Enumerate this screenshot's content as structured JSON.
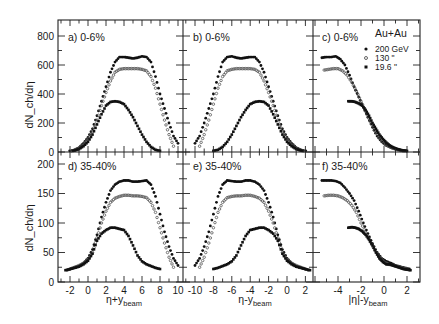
{
  "figure": {
    "system_label": "Au+Au",
    "ylabel": "dN_ch/dη",
    "legend": [
      {
        "label": "200 GeV",
        "marker": "filled-circle",
        "color": "#111111"
      },
      {
        "label": "130  \"",
        "marker": "open-circle",
        "color": "#555555"
      },
      {
        "label": "19.6  \"",
        "marker": "filled-square",
        "color": "#111111"
      }
    ]
  },
  "chart_data": [
    {
      "panel": "a",
      "title": "a) 0-6%",
      "type": "scatter",
      "xlabel": "η+y_beam",
      "ylabel": "dN_ch/dη",
      "xlim": [
        -3.3,
        10.6
      ],
      "ylim": [
        0,
        900
      ],
      "yticks": [
        0,
        200,
        400,
        600,
        800
      ],
      "series": [
        {
          "name": "200 GeV",
          "x": [
            -2.3,
            -1.5,
            -1,
            -0.5,
            0,
            0.5,
            1,
            1.5,
            2,
            2.5,
            3,
            3.5,
            4,
            4.5,
            5,
            5.5,
            6,
            6.5,
            7,
            7.5,
            8,
            8.5,
            9,
            9.5,
            10
          ],
          "y": [
            5,
            15,
            30,
            60,
            100,
            160,
            250,
            350,
            450,
            550,
            620,
            655,
            655,
            650,
            645,
            650,
            660,
            655,
            620,
            520,
            400,
            300,
            200,
            110,
            60
          ]
        },
        {
          "name": "130 GeV",
          "x": [
            -2,
            -1.5,
            -1,
            -0.5,
            0,
            0.5,
            1,
            1.5,
            2,
            2.5,
            3,
            3.5,
            4,
            4.5,
            5,
            5.5,
            6,
            6.5,
            7,
            7.5,
            8,
            8.5,
            9,
            9.5
          ],
          "y": [
            5,
            12,
            25,
            50,
            90,
            140,
            220,
            320,
            410,
            490,
            550,
            570,
            575,
            575,
            575,
            575,
            570,
            560,
            520,
            440,
            330,
            220,
            120,
            40
          ]
        },
        {
          "name": "19.6 GeV",
          "x": [
            -2.5,
            -2,
            -1.5,
            -1,
            -0.5,
            0,
            0.5,
            1,
            1.5,
            2,
            2.5,
            3,
            3.5,
            4,
            4.5,
            5,
            5.5,
            6,
            6.5,
            7,
            7.5,
            8
          ],
          "y": [
            3,
            5,
            10,
            20,
            40,
            70,
            120,
            190,
            260,
            320,
            345,
            350,
            345,
            330,
            290,
            240,
            180,
            120,
            70,
            35,
            15,
            8
          ]
        }
      ]
    },
    {
      "panel": "b",
      "title": "b) 0-6%",
      "type": "scatter",
      "xlabel": "η-y_beam",
      "ylabel": "",
      "xlim": [
        -11.1,
        2.8
      ],
      "ylim": [
        0,
        900
      ],
      "series": [
        {
          "name": "200 GeV",
          "x": [
            -10,
            -9.5,
            -9,
            -8.5,
            -8,
            -7.5,
            -7,
            -6.5,
            -6,
            -5.5,
            -5,
            -4.5,
            -4,
            -3.5,
            -3,
            -2.5,
            -2,
            -1.5,
            -1,
            -0.5,
            0,
            0.5,
            1,
            1.5,
            2.3
          ],
          "y": [
            60,
            110,
            200,
            300,
            400,
            520,
            620,
            655,
            660,
            650,
            645,
            650,
            655,
            655,
            620,
            550,
            450,
            350,
            250,
            160,
            100,
            60,
            30,
            15,
            5
          ]
        },
        {
          "name": "130 GeV",
          "x": [
            -9.5,
            -9,
            -8.5,
            -8,
            -7.5,
            -7,
            -6.5,
            -6,
            -5.5,
            -5,
            -4.5,
            -4,
            -3.5,
            -3,
            -2.5,
            -2,
            -1.5,
            -1,
            -0.5,
            0,
            0.5,
            1,
            1.5,
            2
          ],
          "y": [
            40,
            120,
            220,
            330,
            440,
            520,
            560,
            570,
            575,
            575,
            575,
            575,
            570,
            550,
            490,
            410,
            320,
            220,
            140,
            90,
            50,
            25,
            12,
            5
          ]
        },
        {
          "name": "19.6 GeV",
          "x": [
            -8,
            -7.5,
            -7,
            -6.5,
            -6,
            -5.5,
            -5,
            -4.5,
            -4,
            -3.5,
            -3,
            -2.5,
            -2,
            -1.5,
            -1,
            -0.5,
            0,
            0.5,
            1,
            1.5,
            2,
            2.5
          ],
          "y": [
            8,
            15,
            35,
            70,
            120,
            180,
            240,
            290,
            330,
            345,
            350,
            345,
            320,
            260,
            190,
            120,
            70,
            40,
            20,
            10,
            5,
            3
          ]
        }
      ]
    },
    {
      "panel": "c",
      "title": "c) 0-6%",
      "type": "scatter",
      "xlabel": "|η|-y_beam",
      "ylabel": "",
      "xlim": [
        -6.2,
        3.1
      ],
      "ylim": [
        0,
        900
      ],
      "series": [
        {
          "name": "200 GeV",
          "x": [
            -5.4,
            -5,
            -4.6,
            -4.2,
            -3.8,
            -3.4,
            -3,
            -2.6,
            -2.2,
            -1.8,
            -1.4,
            -1,
            -0.6,
            -0.2,
            0.2,
            0.6,
            1,
            1.4,
            1.8,
            2.2
          ],
          "y": [
            650,
            655,
            655,
            660,
            640,
            600,
            530,
            450,
            380,
            310,
            240,
            170,
            110,
            70,
            45,
            30,
            20,
            12,
            8,
            5
          ]
        },
        {
          "name": "130 GeV",
          "x": [
            -5.2,
            -4.8,
            -4.4,
            -4,
            -3.6,
            -3.2,
            -2.8,
            -2.4,
            -2,
            -1.6,
            -1.2,
            -0.8,
            -0.4,
            0,
            0.4,
            0.8,
            1.2,
            1.6,
            2
          ],
          "y": [
            565,
            570,
            575,
            575,
            560,
            530,
            480,
            420,
            350,
            280,
            210,
            150,
            100,
            60,
            40,
            25,
            15,
            8,
            5
          ]
        },
        {
          "name": "19.6 GeV",
          "x": [
            -3.1,
            -2.8,
            -2.5,
            -2.2,
            -1.9,
            -1.6,
            -1.3,
            -1,
            -0.7,
            -0.4,
            -0.1,
            0.2,
            0.5,
            0.8,
            1.1,
            1.4,
            1.7,
            2,
            2.3
          ],
          "y": [
            350,
            350,
            345,
            335,
            320,
            290,
            250,
            200,
            160,
            120,
            90,
            65,
            45,
            32,
            22,
            15,
            10,
            7,
            5
          ]
        }
      ]
    },
    {
      "panel": "d",
      "title": "d) 35-40%",
      "type": "scatter",
      "xlabel": "η+y_beam",
      "ylabel": "dN_ch/dη",
      "xlim": [
        -3.3,
        10.6
      ],
      "ylim": [
        0,
        210
      ],
      "yticks": [
        0,
        50,
        100,
        150,
        200
      ],
      "xticks": [
        -2,
        0,
        2,
        4,
        6,
        8,
        10
      ],
      "series": [
        {
          "name": "200 GeV",
          "x": [
            -2.3,
            -1.5,
            -1,
            -0.5,
            0,
            0.5,
            1,
            1.5,
            2,
            2.5,
            3,
            3.5,
            4,
            4.5,
            5,
            5.5,
            6,
            6.5,
            7,
            7.5,
            8,
            8.5,
            9,
            9.5,
            10
          ],
          "y": [
            20,
            24,
            27,
            32,
            40,
            55,
            80,
            110,
            135,
            155,
            165,
            170,
            172,
            172,
            170,
            170,
            171,
            172,
            165,
            145,
            115,
            85,
            60,
            40,
            28
          ]
        },
        {
          "name": "130 GeV",
          "x": [
            -2,
            -1.5,
            -1,
            -0.5,
            0,
            0.5,
            1,
            1.5,
            2,
            2.5,
            3,
            3.5,
            4,
            4.5,
            5,
            5.5,
            6,
            6.5,
            7,
            7.5,
            8,
            8.5,
            9,
            9.5
          ],
          "y": [
            22,
            25,
            28,
            32,
            38,
            50,
            75,
            100,
            120,
            135,
            142,
            145,
            147,
            147,
            146,
            146,
            145,
            143,
            135,
            118,
            92,
            66,
            42,
            25
          ]
        },
        {
          "name": "19.6 GeV",
          "x": [
            -2.5,
            -2,
            -1.5,
            -1,
            -0.5,
            0,
            0.5,
            1,
            1.5,
            2,
            2.5,
            3,
            3.5,
            4,
            4.5,
            5,
            5.5,
            6,
            6.5,
            7,
            7.5,
            8
          ],
          "y": [
            20,
            22,
            24,
            26,
            30,
            36,
            48,
            70,
            82,
            88,
            92,
            92,
            90,
            88,
            78,
            62,
            45,
            35,
            30,
            27,
            24,
            22
          ]
        }
      ]
    },
    {
      "panel": "e",
      "title": "e) 35-40%",
      "type": "scatter",
      "xlabel": "η-y_beam",
      "ylabel": "",
      "xlim": [
        -11.1,
        2.8
      ],
      "xticks": [
        -10,
        -8,
        -6,
        -4,
        -2,
        0,
        2
      ],
      "series": [
        {
          "name": "200 GeV",
          "x": [
            -10,
            -9.5,
            -9,
            -8.5,
            -8,
            -7.5,
            -7,
            -6.5,
            -6,
            -5.5,
            -5,
            -4.5,
            -4,
            -3.5,
            -3,
            -2.5,
            -2,
            -1.5,
            -1,
            -0.5,
            0,
            0.5,
            1,
            1.5,
            2.3
          ],
          "y": [
            28,
            40,
            60,
            85,
            115,
            145,
            165,
            172,
            171,
            170,
            170,
            172,
            172,
            170,
            165,
            155,
            135,
            110,
            80,
            55,
            40,
            32,
            27,
            24,
            20
          ]
        },
        {
          "name": "130 GeV",
          "x": [
            -9.5,
            -9,
            -8.5,
            -8,
            -7.5,
            -7,
            -6.5,
            -6,
            -5.5,
            -5,
            -4.5,
            -4,
            -3.5,
            -3,
            -2.5,
            -2,
            -1.5,
            -1,
            -0.5,
            0,
            0.5,
            1,
            1.5,
            2
          ],
          "y": [
            25,
            42,
            66,
            92,
            118,
            135,
            143,
            145,
            146,
            146,
            147,
            147,
            145,
            142,
            135,
            120,
            100,
            75,
            50,
            38,
            32,
            28,
            25,
            22
          ]
        },
        {
          "name": "19.6 GeV",
          "x": [
            -8,
            -7.5,
            -7,
            -6.5,
            -6,
            -5.5,
            -5,
            -4.5,
            -4,
            -3.5,
            -3,
            -2.5,
            -2,
            -1.5,
            -1,
            -0.5,
            0,
            0.5,
            1,
            1.5,
            2,
            2.5
          ],
          "y": [
            22,
            24,
            27,
            30,
            35,
            45,
            62,
            78,
            88,
            90,
            92,
            92,
            88,
            82,
            70,
            48,
            36,
            30,
            26,
            24,
            22,
            20
          ]
        }
      ]
    },
    {
      "panel": "f",
      "title": "f) 35-40%",
      "type": "scatter",
      "xlabel": "|η|-y_beam",
      "ylabel": "",
      "xlim": [
        -6.2,
        3.1
      ],
      "xticks": [
        -4,
        -2,
        0,
        2
      ],
      "series": [
        {
          "name": "200 GeV",
          "x": [
            -5.4,
            -5,
            -4.6,
            -4.2,
            -3.8,
            -3.4,
            -3,
            -2.6,
            -2.2,
            -1.8,
            -1.4,
            -1,
            -0.6,
            -0.2,
            0.2,
            0.6,
            1,
            1.4,
            1.8,
            2.2
          ],
          "y": [
            172,
            172,
            172,
            171,
            168,
            160,
            150,
            138,
            120,
            100,
            82,
            65,
            50,
            40,
            35,
            32,
            28,
            26,
            24,
            22
          ]
        },
        {
          "name": "130 GeV",
          "x": [
            -5.2,
            -4.8,
            -4.4,
            -4,
            -3.6,
            -3.2,
            -2.8,
            -2.4,
            -2,
            -1.6,
            -1.2,
            -0.8,
            -0.4,
            0,
            0.4,
            0.8,
            1.2,
            1.6,
            2
          ],
          "y": [
            146,
            147,
            147,
            146,
            143,
            138,
            130,
            118,
            100,
            84,
            68,
            54,
            42,
            34,
            30,
            28,
            26,
            24,
            22
          ]
        },
        {
          "name": "19.6 GeV",
          "x": [
            -3.1,
            -2.8,
            -2.5,
            -2.2,
            -1.9,
            -1.6,
            -1.3,
            -1,
            -0.7,
            -0.4,
            -0.1,
            0.2,
            0.5,
            0.8,
            1.1,
            1.4,
            1.7,
            2,
            2.3
          ],
          "y": [
            92,
            93,
            92,
            90,
            86,
            80,
            72,
            62,
            50,
            40,
            34,
            30,
            30,
            28,
            26,
            24,
            22,
            21,
            20
          ]
        }
      ]
    }
  ],
  "axis_labels": {
    "top_y": "dN_ch/dη",
    "bottom_y": "dN_ch/dη",
    "x_a": "η+y",
    "x_b": "η-y",
    "x_c": "|η|-y",
    "sub": "beam"
  },
  "tick_labels": {
    "top_y": [
      "0",
      "200",
      "400",
      "600",
      "800"
    ],
    "bottom_y": [
      "0",
      "50",
      "100",
      "150",
      "200"
    ],
    "x_a": [
      "-2",
      "0",
      "2",
      "4",
      "6",
      "8",
      "10"
    ],
    "x_b": [
      "-10",
      "-8",
      "-6",
      "-4",
      "-2",
      "0",
      "2"
    ],
    "x_c": [
      "-4",
      "-2",
      "0",
      "2"
    ]
  }
}
